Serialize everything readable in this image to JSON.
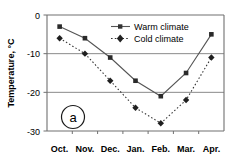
{
  "chart_data": {
    "type": "line",
    "title": "",
    "panel_label": "a",
    "xlabel": "",
    "ylabel": "Temperature, °C",
    "categories": [
      "Oct.",
      "Nov.",
      "Dec.",
      "Jan.",
      "Feb.",
      "Mar.",
      "Apr."
    ],
    "ylim": [
      -30,
      0
    ],
    "yticks": [
      0,
      -10,
      -20,
      -30
    ],
    "ytick_labels": [
      "0",
      "-10",
      "-20",
      "-30"
    ],
    "grid": "horizontal",
    "legend_position": "upper-center",
    "series": [
      {
        "name": "Warm climate",
        "values": [
          -3,
          -6,
          -11,
          -17,
          -21,
          -15,
          -5
        ],
        "line_style": "solid",
        "marker": "square",
        "color": "#555555"
      },
      {
        "name": "Cold climate",
        "values": [
          -6,
          -10,
          -17,
          -24,
          -28,
          -22,
          -11
        ],
        "line_style": "dotted",
        "marker": "diamond",
        "color": "#333333"
      }
    ]
  },
  "axis": {
    "y_title": "Temperature, °C",
    "y_tick_0": "0",
    "y_tick_1": "-10",
    "y_tick_2": "-20",
    "y_tick_3": "-30",
    "x_tick_0": "Oct.",
    "x_tick_1": "Nov.",
    "x_tick_2": "Dec.",
    "x_tick_3": "Jan.",
    "x_tick_4": "Feb.",
    "x_tick_5": "Mar.",
    "x_tick_6": "Apr."
  },
  "legend": {
    "item_0": "Warm climate",
    "item_1": "Cold climate"
  },
  "panel": {
    "label": "a"
  },
  "colors": {
    "warm": "#555555",
    "cold": "#333333",
    "grid": "#888888",
    "axis": "#666666",
    "background": "#ffffff"
  }
}
